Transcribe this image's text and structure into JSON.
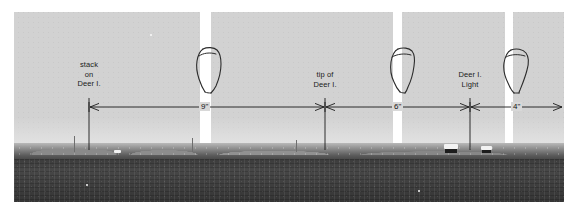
{
  "figure": {
    "kind": "annotated-panoramic-photograph",
    "colors": {
      "sky": "#d2d2d2",
      "water": "#3e3e3e",
      "shore": "#6a6a6a",
      "annotation_ink": "#1a1a1a",
      "gap": "#ffffff"
    }
  },
  "labels": [
    {
      "id": "stack-on-deer-i",
      "lines": [
        "stack",
        "on",
        "Deer I."
      ],
      "text": "stack on Deer I."
    },
    {
      "id": "tip-of-deer-i",
      "lines": [
        "tip of",
        "Deer I."
      ],
      "text": "tip of Deer I."
    },
    {
      "id": "deer-i-light",
      "lines": [
        "Deer I.",
        "Light"
      ],
      "text": "Deer I. Light"
    }
  ],
  "dimensions": [
    {
      "id": "dim-9",
      "value": "9\"",
      "from": "stack on Deer I.",
      "to": "tip of Deer I."
    },
    {
      "id": "dim-6",
      "value": "6\"",
      "from": "tip of Deer I.",
      "to": "Deer I. Light"
    },
    {
      "id": "dim-4",
      "value": "4\"",
      "from": "Deer I. Light",
      "to": "right edge"
    }
  ],
  "sketches": [
    {
      "id": "sketch-1",
      "name": "hand-drawn-outline-left"
    },
    {
      "id": "sketch-2",
      "name": "hand-drawn-outline-middle"
    },
    {
      "id": "sketch-3",
      "name": "hand-drawn-outline-right"
    }
  ]
}
